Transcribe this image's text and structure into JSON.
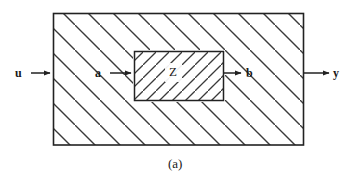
{
  "figure": {
    "caption": "(a)",
    "outer_block": {
      "name": "outer-system-block",
      "fill_pattern": "diagonal-hatch-backslash",
      "border_color": "#222222"
    },
    "inner_block": {
      "name": "inner-uncertainty-block",
      "label": "Z",
      "fill_pattern": "diagonal-hatch-slash",
      "border_color": "#222222"
    },
    "signals": [
      {
        "label": "u",
        "name": "signal-u",
        "direction": "in",
        "target": "outer-block-left"
      },
      {
        "label": "a",
        "name": "signal-a",
        "direction": "in",
        "target": "inner-block-left"
      },
      {
        "label": "b",
        "name": "signal-b",
        "direction": "out",
        "target": "inner-block-right"
      },
      {
        "label": "y",
        "name": "signal-y",
        "direction": "out",
        "target": "outer-block-right"
      }
    ],
    "colors": {
      "line": "#222222",
      "hatch": "#3a3a3a",
      "text": "#1a1a1a",
      "background": "#ffffff"
    }
  }
}
